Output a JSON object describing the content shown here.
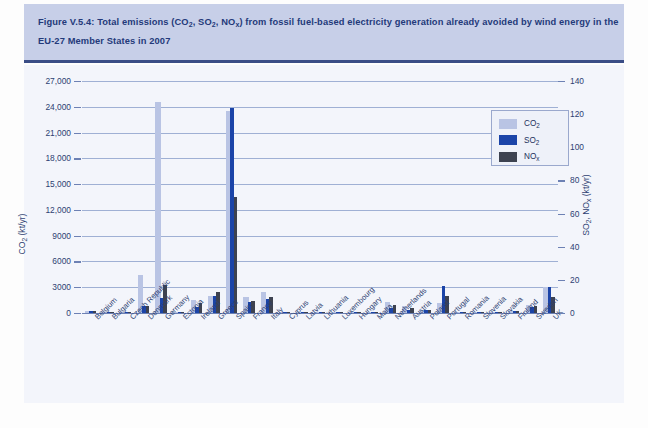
{
  "caption": {
    "line1_pre": "Figure V.5.4: Total emissions (CO",
    "line1_sub1": "2",
    "line1_mid1": ", SO",
    "line1_sub2": "2",
    "line1_mid2": ", NO",
    "line1_sub3": "x",
    "line1_post": ") from fossil fuel-based electricity generation already avoided by wind energy in the",
    "line2": "EU-27 Member States in 2007"
  },
  "source_note": "Source: Auer et al. (2007)",
  "legend": {
    "items": [
      {
        "label_main": "CO",
        "label_sub": "2",
        "color": "#b9c4e4",
        "key": "co2"
      },
      {
        "label_main": "SO",
        "label_sub": "2",
        "color": "#1b44a8",
        "key": "so2"
      },
      {
        "label_main": "NO",
        "label_sub": "x",
        "color": "#3d4250",
        "key": "nox"
      }
    ]
  },
  "chart_data": {
    "type": "bar",
    "title": "Total emissions (CO2, SO2, NOx) from fossil fuel-based electricity generation already avoided by wind energy in the EU-27 Member States in 2007",
    "xlabel": "",
    "ylabel_left_main": "CO",
    "ylabel_left_sub": "2",
    "ylabel_left_unit": " (kt/yr)",
    "ylabel_right_main_a": "SO",
    "ylabel_right_sub_a": "2",
    "ylabel_right_sep": ", NO",
    "ylabel_right_sub_b": "x",
    "ylabel_right_unit": " (kt/yr)",
    "ylim_left": [
      0,
      27000
    ],
    "ylim_right": [
      0,
      140
    ],
    "yticks_left": [
      0,
      3000,
      6000,
      9000,
      12000,
      15000,
      18000,
      21000,
      24000,
      27000
    ],
    "ytick_labels_left": [
      "0",
      "3000",
      "6000",
      "9000",
      "12,000",
      "15,000",
      "18,000",
      "21,000",
      "24,000",
      "27,000"
    ],
    "yticks_right": [
      0,
      20,
      40,
      60,
      80,
      100,
      120,
      140
    ],
    "ytick_labels_right": [
      "0",
      "20",
      "40",
      "60",
      "80",
      "100",
      "120",
      "140"
    ],
    "grid": true,
    "legend_position": "upper right",
    "categories": [
      "Belgium",
      "Bulgaria",
      "Czech Republic",
      "Denmark",
      "Germany",
      "Estonia",
      "Ireland",
      "Greece",
      "Spain",
      "France",
      "Italy",
      "Cyprus",
      "Latvia",
      "Lithuania",
      "Luxembourg",
      "Hungary",
      "Malta",
      "Netherlands",
      "Austria",
      "Poland",
      "Portugal",
      "Romania",
      "Slovenia",
      "Slovakia",
      "Finland",
      "Sweden",
      "UK"
    ],
    "series": [
      {
        "name": "CO2",
        "axis": "left",
        "unit": "kt/yr",
        "color": "#b9c4e4",
        "values": [
          230,
          60,
          90,
          4400,
          24600,
          130,
          1500,
          2000,
          23500,
          1900,
          2400,
          90,
          60,
          60,
          130,
          130,
          30,
          1250,
          830,
          380,
          1150,
          60,
          30,
          60,
          210,
          900,
          3000
        ]
      },
      {
        "name": "SO2",
        "axis": "right",
        "unit": "kt/yr",
        "color": "#1b44a8",
        "values": [
          1.1,
          0.3,
          0.5,
          4.0,
          9.0,
          0.7,
          3.5,
          10.0,
          124.0,
          6.5,
          8.5,
          0.5,
          0.3,
          0.3,
          0.7,
          0.7,
          0.2,
          3.0,
          2.0,
          1.9,
          16.5,
          0.3,
          0.2,
          0.3,
          1.1,
          3.5,
          16.0
        ]
      },
      {
        "name": "NOx",
        "axis": "right",
        "unit": "kt/yr",
        "color": "#3d4250",
        "values": [
          1.3,
          0.3,
          0.5,
          4.2,
          17.0,
          0.8,
          6.0,
          12.5,
          70.0,
          7.5,
          9.5,
          0.5,
          0.3,
          0.3,
          0.8,
          0.8,
          0.2,
          5.0,
          3.0,
          2.0,
          10.0,
          0.3,
          0.2,
          0.3,
          1.3,
          4.5,
          9.5
        ]
      }
    ]
  }
}
